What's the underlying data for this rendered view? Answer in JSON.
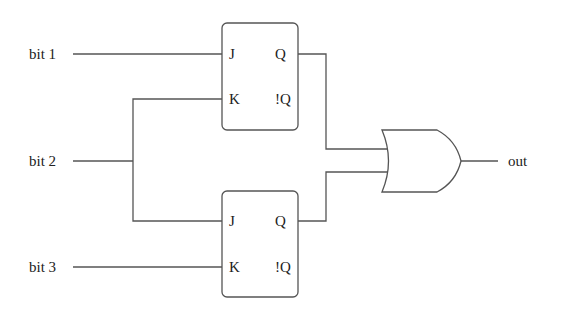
{
  "diagram": {
    "type": "logic-circuit",
    "inputs": [
      {
        "id": "bit1",
        "label": "bit 1"
      },
      {
        "id": "bit2",
        "label": "bit 2"
      },
      {
        "id": "bit3",
        "label": "bit 3"
      }
    ],
    "output": {
      "id": "out",
      "label": "out"
    },
    "flip_flops": [
      {
        "id": "ff_top",
        "type": "JK",
        "pins": {
          "j": "J",
          "k": "K",
          "q": "Q",
          "nq": "!Q"
        }
      },
      {
        "id": "ff_bottom",
        "type": "JK",
        "pins": {
          "j": "J",
          "k": "K",
          "q": "Q",
          "nq": "!Q"
        }
      }
    ],
    "gates": [
      {
        "id": "or1",
        "type": "OR",
        "inputs": [
          "ff_top.Q",
          "ff_bottom.Q"
        ],
        "output": "out"
      }
    ],
    "connections": [
      {
        "from": "bit1",
        "to": "ff_top.J"
      },
      {
        "from": "bit2",
        "to": "ff_top.K"
      },
      {
        "from": "bit2",
        "to": "ff_bottom.J"
      },
      {
        "from": "bit3",
        "to": "ff_bottom.K"
      },
      {
        "from": "ff_top.Q",
        "to": "or1.in1"
      },
      {
        "from": "ff_bottom.Q",
        "to": "or1.in2"
      },
      {
        "from": "or1.out",
        "to": "out"
      }
    ],
    "colors": {
      "line": "#555555",
      "text": "#222222",
      "background": "#ffffff"
    }
  }
}
